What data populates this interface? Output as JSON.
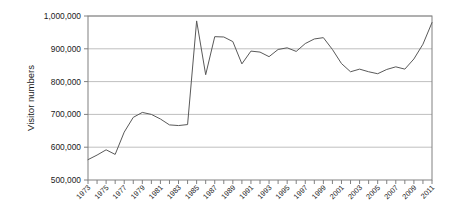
{
  "chart_data": {
    "type": "line",
    "title": "",
    "xlabel": "",
    "ylabel": "Visitor numbers",
    "ylim": [
      500000,
      1000000
    ],
    "xlim": [
      1973,
      2011
    ],
    "ytick_values": [
      500000,
      600000,
      700000,
      800000,
      900000,
      1000000
    ],
    "ytick_labels": [
      "500,000",
      "600,000",
      "700,000",
      "800,000",
      "900,000",
      "1,000,000"
    ],
    "xtick_labels": [
      "1973",
      "1975",
      "1977",
      "1979",
      "1981",
      "1983",
      "1985",
      "1987",
      "1989",
      "1991",
      "1993",
      "1995",
      "1997",
      "1999",
      "2001",
      "2003",
      "2005",
      "2007",
      "2009",
      "2011"
    ],
    "xtick_label_rotation": -45,
    "xtick_every_year": true,
    "grid": true,
    "grid_axis": "y",
    "legend": false,
    "legend_position": "none",
    "line_color": "#595959",
    "grid_color": "#bfbfbf",
    "frame_color": "#808080",
    "x": [
      1973,
      1974,
      1975,
      1976,
      1977,
      1978,
      1979,
      1980,
      1981,
      1982,
      1983,
      1984,
      1985,
      1986,
      1987,
      1988,
      1989,
      1990,
      1991,
      1992,
      1993,
      1994,
      1995,
      1996,
      1997,
      1998,
      1999,
      2000,
      2001,
      2002,
      2003,
      2004,
      2005,
      2006,
      2007,
      2008,
      2009,
      2010,
      2011
    ],
    "values": [
      562000,
      576000,
      592000,
      578000,
      646000,
      691000,
      706000,
      700000,
      686000,
      668000,
      666000,
      669000,
      985000,
      821000,
      937000,
      936000,
      922000,
      854000,
      893000,
      890000,
      876000,
      898000,
      903000,
      892000,
      916000,
      930000,
      934000,
      898000,
      855000,
      830000,
      838000,
      830000,
      824000,
      837000,
      845000,
      838000,
      869000,
      914000,
      980000
    ]
  },
  "figure": {
    "plot_left": 88,
    "plot_right": 432,
    "plot_top": 16,
    "plot_bottom": 180
  }
}
